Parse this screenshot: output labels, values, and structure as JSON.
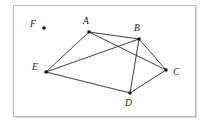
{
  "figure": {
    "title": "",
    "background_color": "#ffffff",
    "frame_color": "#b9b9b9",
    "edge_color": "#2a2a2a",
    "vertex_color": "#1a1a1a"
  },
  "graph": {
    "type": "undirected-graph",
    "vertices": [
      {
        "id": "A",
        "label": "A",
        "x": 89,
        "y": 32,
        "label_x": 83,
        "label_y": 17,
        "isolated": false
      },
      {
        "id": "B",
        "label": "B",
        "x": 139,
        "y": 39,
        "label_x": 134,
        "label_y": 24,
        "isolated": false
      },
      {
        "id": "C",
        "label": "C",
        "x": 166,
        "y": 70,
        "label_x": 173,
        "label_y": 68,
        "isolated": false
      },
      {
        "id": "D",
        "label": "D",
        "x": 130,
        "y": 93,
        "label_x": 125,
        "label_y": 99,
        "isolated": false
      },
      {
        "id": "E",
        "label": "E",
        "x": 46,
        "y": 72,
        "label_x": 32,
        "label_y": 63,
        "isolated": false
      },
      {
        "id": "F",
        "label": "F",
        "x": 44,
        "y": 28,
        "label_x": 30,
        "label_y": 20,
        "isolated": true
      }
    ],
    "edges": [
      {
        "from": "A",
        "to": "B"
      },
      {
        "from": "A",
        "to": "C"
      },
      {
        "from": "A",
        "to": "E"
      },
      {
        "from": "B",
        "to": "C"
      },
      {
        "from": "B",
        "to": "D"
      },
      {
        "from": "B",
        "to": "E"
      },
      {
        "from": "C",
        "to": "D"
      },
      {
        "from": "D",
        "to": "E"
      }
    ],
    "vertex_count": 6,
    "edge_count": 8
  }
}
